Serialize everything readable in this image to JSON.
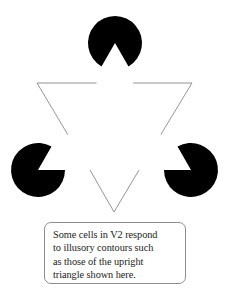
{
  "figure": {
    "name": "Kanizsa illusory-contour triangle figure",
    "background_color": "#ffffff",
    "inducer_color": "#000000",
    "outline_color": "#7a7a7a",
    "caption_border_color": "#8d8d8d",
    "text_color": "#222222",
    "inducers": [
      {
        "id": "top-inducer",
        "label": "top pac-man disc",
        "cx": 115,
        "cy": 43,
        "r": 27,
        "notch_direction": "down",
        "notch_half_angle_deg": 30
      },
      {
        "id": "bottom-left-inducer",
        "label": "bottom-left pac-man disc",
        "cx": 38,
        "cy": 170,
        "r": 27,
        "notch_direction": "upper-right",
        "notch_half_angle_deg": 30
      },
      {
        "id": "bottom-right-inducer",
        "label": "bottom-right pac-man disc",
        "cx": 191,
        "cy": 170,
        "r": 27,
        "notch_direction": "upper-left",
        "notch_half_angle_deg": 30
      }
    ],
    "outline_triangle": {
      "id": "inverted-outline-triangle",
      "label": "downward-pointing outline triangle",
      "orientation": "inverted",
      "vertices": [
        {
          "x": 37,
          "y": 83
        },
        {
          "x": 192,
          "y": 83
        },
        {
          "x": 114,
          "y": 212
        }
      ],
      "stroke_width": 0.8,
      "occluded": true
    },
    "illusory_triangle": {
      "id": "illusory-upright-triangle",
      "label": "illusory upright triangle (subjective contour)",
      "orientation": "upright",
      "vertices": [
        {
          "x": 115,
          "y": 43
        },
        {
          "x": 38,
          "y": 170
        },
        {
          "x": 191,
          "y": 170
        }
      ],
      "visible_edges": false
    }
  },
  "caption": {
    "id": "caption-box",
    "lines": [
      "Some cells in V2 respond",
      "to illusory contours such",
      "as those of the upright",
      "triangle shown here."
    ],
    "full_text": "Some cells in V2 respond to illusory contours such as those of the upright triangle shown here."
  }
}
